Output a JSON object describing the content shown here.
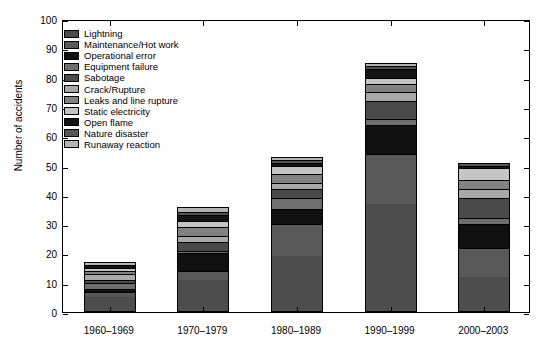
{
  "chart_data": {
    "type": "bar",
    "subtype": "stacked",
    "title": "",
    "xlabel": "",
    "ylabel": "Number of accidents",
    "ylim": [
      0,
      100
    ],
    "yticks": [
      0,
      10,
      20,
      30,
      40,
      50,
      60,
      70,
      80,
      90,
      100
    ],
    "grid": false,
    "legend_position": "upper left inside",
    "categories": [
      "1960–1969",
      "1970–1979",
      "1980–1989",
      "1990–1999",
      "2000–2003"
    ],
    "totals": [
      17,
      36,
      53,
      85,
      51
    ],
    "series": [
      {
        "name": "Lightning",
        "color": "#4d4d4d",
        "values": [
          5,
          11,
          19,
          37,
          12
        ]
      },
      {
        "name": "Maintenance/Hot work",
        "color": "#595959",
        "values": [
          2,
          3,
          11,
          17,
          10
        ]
      },
      {
        "name": "Operational error",
        "color": "#111111",
        "values": [
          1,
          6,
          5,
          10,
          8
        ]
      },
      {
        "name": "Equipment failure",
        "color": "#6e6e6e",
        "values": [
          2,
          1,
          4,
          2,
          2
        ]
      },
      {
        "name": "Sabotage",
        "color": "#4a4a4a",
        "values": [
          1,
          3,
          3,
          6,
          7
        ]
      },
      {
        "name": "Crack/Rupture",
        "color": "#a8a8a8",
        "values": [
          2,
          2,
          2,
          3,
          3
        ]
      },
      {
        "name": "Leaks and line rupture",
        "color": "#818181",
        "values": [
          1,
          3,
          3,
          3,
          3
        ]
      },
      {
        "name": "Static electricity",
        "color": "#c4c4c4",
        "values": [
          1,
          2,
          3,
          2,
          4
        ]
      },
      {
        "name": "Open flame",
        "color": "#141414",
        "values": [
          1,
          2,
          1,
          3,
          1
        ]
      },
      {
        "name": "Nature disaster",
        "color": "#555555",
        "values": [
          0,
          1,
          1,
          1,
          1
        ]
      },
      {
        "name": "Runaway reaction",
        "color": "#b5b5b5",
        "values": [
          1,
          2,
          1,
          1,
          0
        ]
      }
    ]
  }
}
